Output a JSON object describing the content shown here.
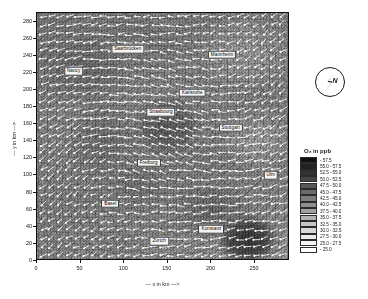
{
  "figure": {
    "xlabel": "--- x in km --->",
    "ylabel": "--- y in km --->"
  },
  "legend": {
    "title": "O₃ in ppb",
    "entries": [
      {
        "label": "-   57.5",
        "color": "#101010"
      },
      {
        "label": "55.0 - 57.5",
        "color": "#222222"
      },
      {
        "label": "52.5 - 55.0",
        "color": "#333333"
      },
      {
        "label": "50.0 - 52.5",
        "color": "#454545"
      },
      {
        "label": "47.5 - 50.0",
        "color": "#575757"
      },
      {
        "label": "45.0 - 47.5",
        "color": "#6b6b6b"
      },
      {
        "label": "42.5 - 45.0",
        "color": "#7d7d7d"
      },
      {
        "label": "40.0 - 42.5",
        "color": "#8f8f8f"
      },
      {
        "label": "37.5 - 40.0",
        "color": "#a1a1a1"
      },
      {
        "label": "35.0 - 37.5",
        "color": "#b3b3b3"
      },
      {
        "label": "32.5 - 35.0",
        "color": "#c5c5c5"
      },
      {
        "label": "30.0 - 32.5",
        "color": "#d7d7d7"
      },
      {
        "label": "27.5 - 30.0",
        "color": "#e9e9e9"
      },
      {
        "label": "25.0 - 27.5",
        "color": "#f4f4f4"
      },
      {
        "label": "-   25.0",
        "color": "#ffffff"
      }
    ]
  },
  "compass": {
    "north_label": "N"
  },
  "chart_data": {
    "type": "heatmap",
    "title": "",
    "xlabel": "--- x in km --->",
    "ylabel": "--- y in km --->",
    "xlim": [
      0,
      290
    ],
    "ylim": [
      0,
      290
    ],
    "xticks": [
      0,
      50,
      100,
      150,
      200,
      250
    ],
    "yticks": [
      0,
      20,
      40,
      60,
      80,
      100,
      120,
      140,
      160,
      180,
      200,
      220,
      240,
      260,
      280
    ],
    "grid": false,
    "colorbar_label": "O₃ in ppb",
    "colorbar_range": [
      25.0,
      57.5
    ],
    "colorbar_step": 2.5,
    "overlays": [
      "wind-vectors",
      "contour-lines",
      "city-labels",
      "north-arrow"
    ],
    "city_markers": [
      {
        "name": "Saarbrücken",
        "x": 104,
        "y": 248
      },
      {
        "name": "Mannheim",
        "x": 212,
        "y": 241
      },
      {
        "name": "Nancy",
        "x": 42,
        "y": 222
      },
      {
        "name": "Karlsruhe",
        "x": 178,
        "y": 197
      },
      {
        "name": "Strasbourg",
        "x": 142,
        "y": 174
      },
      {
        "name": "Stuttgart",
        "x": 222,
        "y": 156
      },
      {
        "name": "Freiburg",
        "x": 128,
        "y": 115
      },
      {
        "name": "Ulm",
        "x": 268,
        "y": 100
      },
      {
        "name": "Basel",
        "x": 84,
        "y": 67
      },
      {
        "name": "Konstanz",
        "x": 200,
        "y": 37
      },
      {
        "name": "Zürich",
        "x": 140,
        "y": 23
      }
    ]
  }
}
